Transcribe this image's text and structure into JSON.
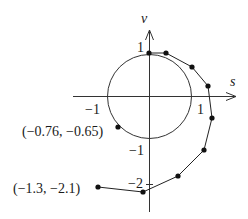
{
  "diagram": {
    "axes": {
      "x_label": "s",
      "y_label": "v",
      "tick_labels": {
        "x_neg_one": "−1",
        "x_pos_one": "1",
        "y_pos_one": "1",
        "y_neg_one": "−1",
        "y_neg_two": "−2"
      }
    },
    "unit_circle": {
      "center": [
        0,
        0
      ],
      "radius": 1
    },
    "points": [
      {
        "s": 0,
        "v": 1
      },
      {
        "s": 0.4,
        "v": 1.0
      },
      {
        "s": 1.0,
        "v": 0.7
      },
      {
        "s": 1.4,
        "v": 0.25
      },
      {
        "s": 1.5,
        "v": -0.5
      },
      {
        "s": 1.3,
        "v": -1.25
      },
      {
        "s": 0.7,
        "v": -1.9
      },
      {
        "s": -0.15,
        "v": -2.25
      },
      {
        "s": -1.3,
        "v": -2.1
      }
    ],
    "circle_point": {
      "s": -0.76,
      "v": -0.65
    },
    "annotations": {
      "circle_point_label": "(−0.76, −0.65)",
      "end_point_label": "(−1.3, −2.1)"
    }
  }
}
